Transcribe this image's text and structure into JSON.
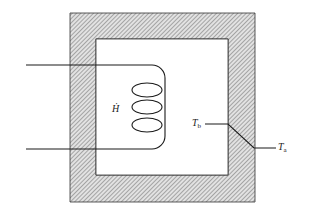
{
  "diagram": {
    "labels": {
      "heat_rate": "Ḣ",
      "temp_inner_base": "T",
      "temp_inner_sub": "b",
      "temp_outer_base": "T",
      "temp_outer_sub": "a"
    },
    "colors": {
      "line": "#1a1a1a",
      "hatch": "#8a8a8a",
      "wall_fill": "#d6d6d6"
    }
  }
}
